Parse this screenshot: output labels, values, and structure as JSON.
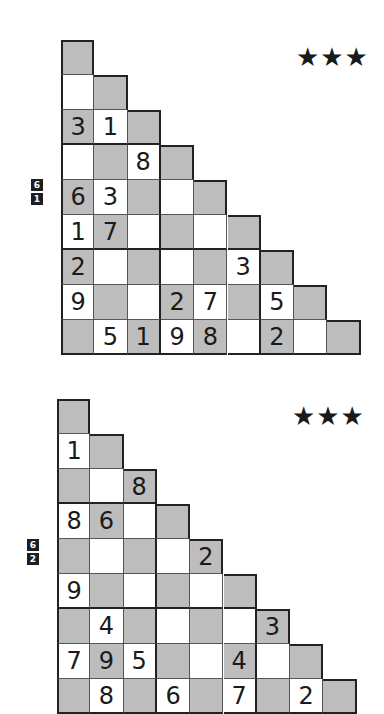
{
  "puzzles": [
    {
      "difficulty_stars": "★★★",
      "difficulty": 3,
      "badge": [
        "6",
        "1"
      ],
      "rows": [
        [
          {
            "c": "g",
            "v": ""
          }
        ],
        [
          {
            "c": "w",
            "v": ""
          },
          {
            "c": "g",
            "v": ""
          }
        ],
        [
          {
            "c": "g",
            "v": "3"
          },
          {
            "c": "w",
            "v": "1"
          },
          {
            "c": "g",
            "v": ""
          }
        ],
        [
          {
            "c": "w",
            "v": ""
          },
          {
            "c": "g",
            "v": ""
          },
          {
            "c": "w",
            "v": "8"
          },
          {
            "c": "g",
            "v": ""
          }
        ],
        [
          {
            "c": "g",
            "v": "6"
          },
          {
            "c": "w",
            "v": "3"
          },
          {
            "c": "g",
            "v": ""
          },
          {
            "c": "w",
            "v": ""
          },
          {
            "c": "g",
            "v": ""
          }
        ],
        [
          {
            "c": "w",
            "v": "1"
          },
          {
            "c": "g",
            "v": "7"
          },
          {
            "c": "w",
            "v": ""
          },
          {
            "c": "g",
            "v": ""
          },
          {
            "c": "w",
            "v": ""
          },
          {
            "c": "g",
            "v": ""
          }
        ],
        [
          {
            "c": "g",
            "v": "2"
          },
          {
            "c": "w",
            "v": ""
          },
          {
            "c": "g",
            "v": ""
          },
          {
            "c": "w",
            "v": ""
          },
          {
            "c": "g",
            "v": ""
          },
          {
            "c": "w",
            "v": "3"
          },
          {
            "c": "g",
            "v": ""
          }
        ],
        [
          {
            "c": "w",
            "v": "9"
          },
          {
            "c": "g",
            "v": ""
          },
          {
            "c": "w",
            "v": ""
          },
          {
            "c": "g",
            "v": "2"
          },
          {
            "c": "w",
            "v": "7"
          },
          {
            "c": "g",
            "v": ""
          },
          {
            "c": "w",
            "v": "5"
          },
          {
            "c": "g",
            "v": ""
          }
        ],
        [
          {
            "c": "g",
            "v": ""
          },
          {
            "c": "w",
            "v": "5"
          },
          {
            "c": "g",
            "v": "1"
          },
          {
            "c": "w",
            "v": "9"
          },
          {
            "c": "g",
            "v": "8"
          },
          {
            "c": "w",
            "v": ""
          },
          {
            "c": "g",
            "v": "2"
          },
          {
            "c": "w",
            "v": ""
          },
          {
            "c": "g",
            "v": ""
          }
        ]
      ]
    },
    {
      "difficulty_stars": "★★★",
      "difficulty": 3,
      "badge": [
        "6",
        "2"
      ],
      "rows": [
        [
          {
            "c": "g",
            "v": ""
          }
        ],
        [
          {
            "c": "w",
            "v": "1"
          },
          {
            "c": "g",
            "v": ""
          }
        ],
        [
          {
            "c": "g",
            "v": ""
          },
          {
            "c": "w",
            "v": ""
          },
          {
            "c": "g",
            "v": "8"
          }
        ],
        [
          {
            "c": "w",
            "v": "8"
          },
          {
            "c": "g",
            "v": "6"
          },
          {
            "c": "w",
            "v": ""
          },
          {
            "c": "g",
            "v": ""
          }
        ],
        [
          {
            "c": "g",
            "v": ""
          },
          {
            "c": "w",
            "v": ""
          },
          {
            "c": "g",
            "v": ""
          },
          {
            "c": "w",
            "v": ""
          },
          {
            "c": "g",
            "v": "2"
          }
        ],
        [
          {
            "c": "w",
            "v": "9"
          },
          {
            "c": "g",
            "v": ""
          },
          {
            "c": "w",
            "v": ""
          },
          {
            "c": "g",
            "v": ""
          },
          {
            "c": "w",
            "v": ""
          },
          {
            "c": "g",
            "v": ""
          }
        ],
        [
          {
            "c": "g",
            "v": ""
          },
          {
            "c": "w",
            "v": "4"
          },
          {
            "c": "g",
            "v": ""
          },
          {
            "c": "w",
            "v": ""
          },
          {
            "c": "g",
            "v": ""
          },
          {
            "c": "w",
            "v": ""
          },
          {
            "c": "g",
            "v": "3"
          }
        ],
        [
          {
            "c": "w",
            "v": "7"
          },
          {
            "c": "g",
            "v": "9"
          },
          {
            "c": "w",
            "v": "5"
          },
          {
            "c": "g",
            "v": ""
          },
          {
            "c": "w",
            "v": ""
          },
          {
            "c": "g",
            "v": "4"
          },
          {
            "c": "w",
            "v": ""
          },
          {
            "c": "g",
            "v": ""
          }
        ],
        [
          {
            "c": "g",
            "v": ""
          },
          {
            "c": "w",
            "v": "8"
          },
          {
            "c": "g",
            "v": ""
          },
          {
            "c": "w",
            "v": "6"
          },
          {
            "c": "g",
            "v": ""
          },
          {
            "c": "w",
            "v": "7"
          },
          {
            "c": "g",
            "v": ""
          },
          {
            "c": "w",
            "v": "2"
          },
          {
            "c": "g",
            "v": ""
          }
        ]
      ]
    }
  ]
}
